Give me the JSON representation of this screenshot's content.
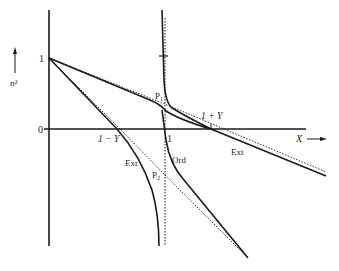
{
  "figure": {
    "y_axis": {
      "label": "n²",
      "arrow": "↑",
      "ticks": [
        {
          "label": "1",
          "value": 1
        },
        {
          "label": "0",
          "value": 0
        }
      ]
    },
    "x_axis": {
      "label": "X",
      "arrow": "⟶",
      "ticks": [
        {
          "label": "1 − Y",
          "value": "1-Y"
        },
        {
          "label": "1",
          "value": 1
        },
        {
          "label": "1 + Y",
          "value": "1+Y"
        }
      ]
    },
    "curve_labels": {
      "ext_upper": "Ext",
      "ext_lower": "Ext",
      "ord": "Ord",
      "point_p1": "P",
      "point_p1_sub": "1",
      "point_p2": "P",
      "point_p2_sub": "2"
    },
    "colors": {
      "line": "#1a1a1a",
      "background": "#ffffff"
    }
  }
}
